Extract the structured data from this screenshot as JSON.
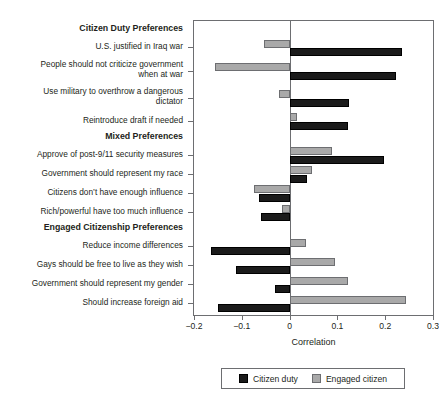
{
  "chart_data": {
    "type": "bar",
    "orientation": "horizontal",
    "title": "",
    "xlabel": "Correlation",
    "ylabel": "",
    "xlim": [
      -0.2,
      0.3
    ],
    "xticks": [
      -0.2,
      -0.1,
      0,
      0.1,
      0.2,
      0.3
    ],
    "xticklabels": [
      "−0.2",
      "−0.1",
      "0",
      "0.1",
      "0.2",
      "0.3"
    ],
    "grid": false,
    "legend_position": "bottom",
    "legend": [
      "Citizen duty",
      "Engaged citizen"
    ],
    "colors": {
      "citizen_duty": "#1b1b1b",
      "engaged_citizen": "#a9a9a9",
      "axis": "#6d6e71",
      "text": "#231f20"
    },
    "group_headers": [
      {
        "label": "Citizen Duty Preferences",
        "before_category": 0
      },
      {
        "label": "Mixed Preferences",
        "before_category": 4
      },
      {
        "label": "Engaged Citizenship Preferences",
        "before_category": 8
      }
    ],
    "categories": [
      "U.S. justified in Iraq war",
      "People should not criticize government\nwhen at war",
      "Use military to overthrow a dangerous\ndictator",
      "Reintroduce draft if needed",
      "Approve of post-9/11 security measures",
      "Government should represent my race",
      "Citizens don’t have enough influence",
      "Rich/powerful have too much influence",
      "Reduce income differences",
      "Gays should be free to live as they wish",
      "Government should represent my gender",
      "Should increase foreign aid"
    ],
    "series": [
      {
        "name": "Citizen duty",
        "color": "#1b1b1b",
        "values": [
          0.236,
          0.222,
          0.124,
          0.122,
          0.197,
          0.037,
          -0.065,
          -0.06,
          -0.164,
          -0.112,
          -0.031,
          -0.15
        ]
      },
      {
        "name": "Engaged citizen",
        "color": "#a9a9a9",
        "values": [
          -0.054,
          -0.157,
          -0.023,
          0.015,
          0.089,
          0.046,
          -0.074,
          -0.015,
          0.034,
          0.095,
          0.123,
          0.243
        ]
      }
    ]
  }
}
